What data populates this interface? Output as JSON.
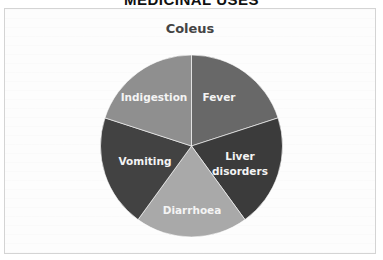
{
  "page": {
    "heading": "MEDICINAL USES"
  },
  "chart_data": {
    "type": "pie",
    "title": "Coleus",
    "categories": [
      "Fever",
      "Liver disorders",
      "Diarrhoea",
      "Vomiting",
      "Indigestion"
    ],
    "values": [
      20,
      20,
      20,
      20,
      20
    ],
    "colors": [
      "#686868",
      "#3b3b3b",
      "#a9a9a9",
      "#424242",
      "#8f8f8f"
    ],
    "start_angle_deg": 0,
    "direction": "clockwise",
    "legend": "none",
    "data_labels": "category names inside slices",
    "xlabel": "",
    "ylabel": ""
  },
  "labels": {
    "fever": "Fever",
    "liver_line1": "Liver",
    "liver_line2": "disorders",
    "diarrhoea": "Diarrhoea",
    "vomiting": "Vomiting",
    "indigestion": "Indigestion"
  }
}
